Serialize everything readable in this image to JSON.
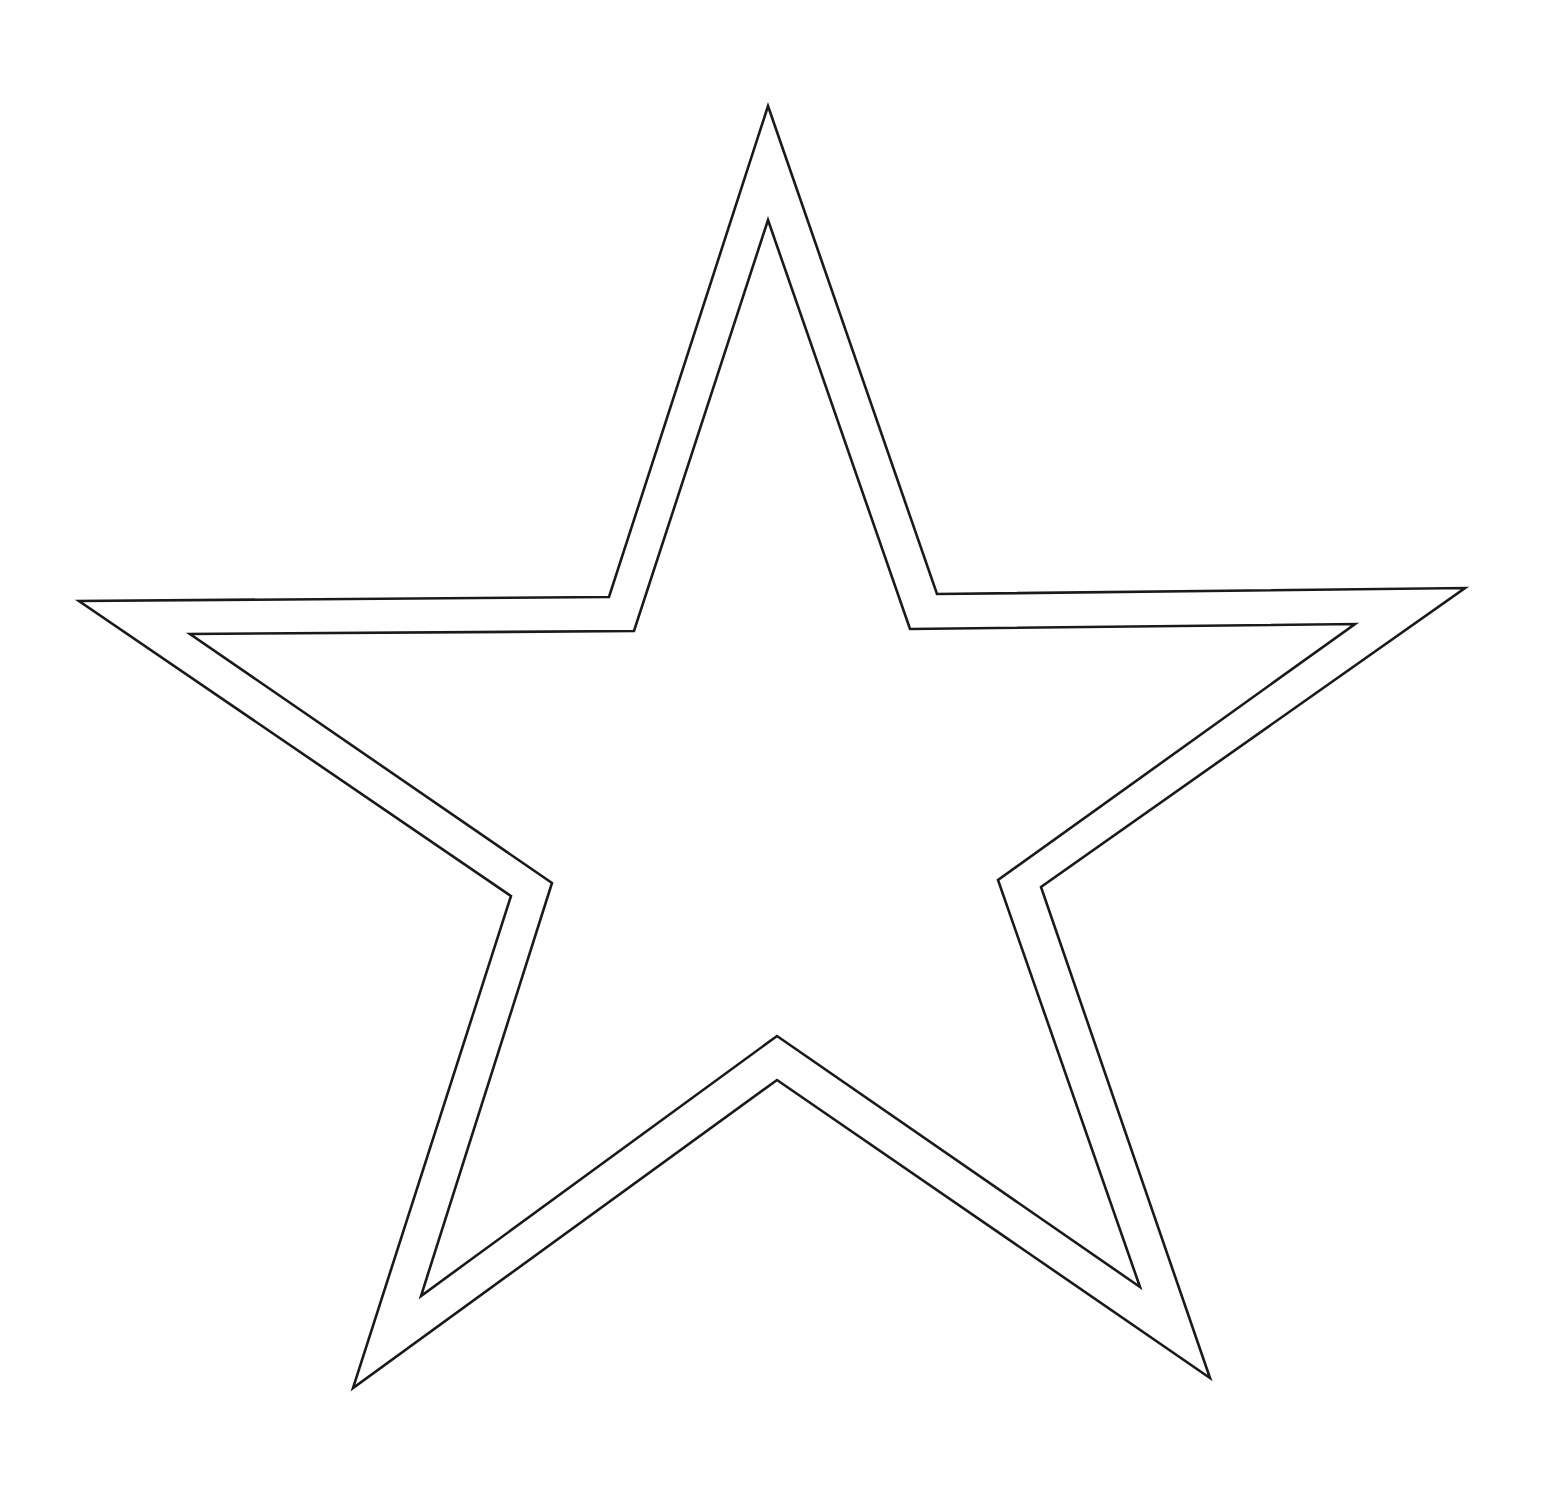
{
  "figure": {
    "background": "#ffffff",
    "stroke_color": "#1a1a1a",
    "stroke_width": 2.6,
    "outer_star": {
      "points": "768,106 937,594 1465,588 1041,887 1210,1378 777,1080 353,1388 511,896 79,601 609,597"
    },
    "inner_star": {
      "points": "768,220 910,629 1355,624 998,880 1140,1287 777,1036 421,1296 552,883 190,634 634,631"
    }
  }
}
